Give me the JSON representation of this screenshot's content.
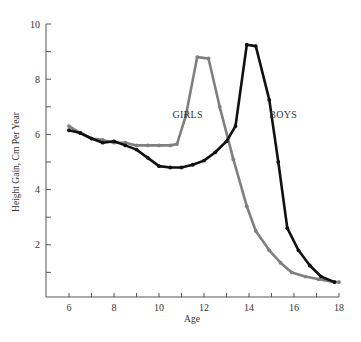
{
  "chart_data": {
    "type": "line",
    "title": "",
    "xlabel": "Age",
    "ylabel": "Height Gain, Cm Per Year",
    "xlim": [
      5,
      18
    ],
    "ylim": [
      0,
      10
    ],
    "grid": false,
    "legend": "inline labels",
    "x_ticks": [
      6,
      7,
      8,
      9,
      10,
      11,
      12,
      13,
      14,
      15,
      16,
      17,
      18
    ],
    "x_tick_labels": [
      "6",
      "8",
      "10",
      "12",
      "14",
      "16",
      "18"
    ],
    "y_ticks": [
      1,
      2,
      3,
      4,
      5,
      6,
      7,
      8,
      9,
      10
    ],
    "y_tick_labels": [
      "2",
      "4",
      "6",
      "8",
      "10"
    ],
    "series": [
      {
        "name": "GIRLS",
        "color": "#7f7f7f",
        "x": [
          6.0,
          6.5,
          7.0,
          7.5,
          8.0,
          8.5,
          9.0,
          9.5,
          10.0,
          10.5,
          10.8,
          11.2,
          11.7,
          12.2,
          12.7,
          13.3,
          13.9,
          14.3,
          14.9,
          15.4,
          15.9,
          16.5,
          17.1,
          17.8,
          18.0
        ],
        "values": [
          6.3,
          6.05,
          5.85,
          5.8,
          5.7,
          5.7,
          5.6,
          5.6,
          5.6,
          5.6,
          5.65,
          6.7,
          8.8,
          8.75,
          7.0,
          5.1,
          3.4,
          2.5,
          1.8,
          1.35,
          1.0,
          0.85,
          0.75,
          0.65,
          0.65
        ]
      },
      {
        "name": "BOYS",
        "color": "#111111",
        "x": [
          6.0,
          6.5,
          7.0,
          7.5,
          8.0,
          8.5,
          9.0,
          9.5,
          10.0,
          10.5,
          11.0,
          11.5,
          12.0,
          12.5,
          13.0,
          13.4,
          13.9,
          14.3,
          14.9,
          15.3,
          15.7,
          16.2,
          16.7,
          17.2,
          17.8
        ],
        "values": [
          6.15,
          6.05,
          5.85,
          5.7,
          5.75,
          5.6,
          5.45,
          5.15,
          4.85,
          4.8,
          4.8,
          4.9,
          5.05,
          5.35,
          5.75,
          6.3,
          9.25,
          9.2,
          7.25,
          5.0,
          2.6,
          1.8,
          1.25,
          0.85,
          0.65
        ]
      }
    ],
    "annotations": [
      {
        "text": "GIRLS",
        "x": 10.6,
        "y": 6.6
      },
      {
        "text": "BOYS",
        "x": 14.9,
        "y": 6.6
      }
    ]
  }
}
